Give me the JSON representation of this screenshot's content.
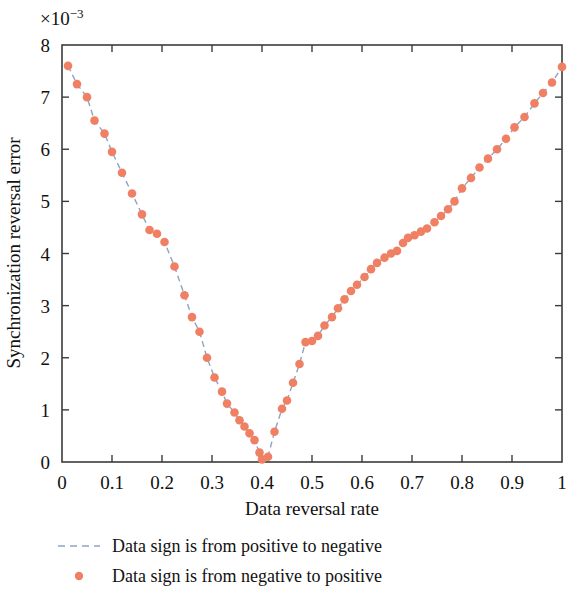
{
  "chart_data": {
    "type": "line",
    "title": "",
    "xlabel": "Data reversal rate",
    "ylabel": "Synchronization reversal error",
    "y_exponent_label": "×10",
    "y_exponent_power": "−3",
    "xlim": [
      0,
      1
    ],
    "ylim": [
      0,
      8
    ],
    "xticks": [
      0,
      0.1,
      0.2,
      0.3,
      0.4,
      0.5,
      0.6,
      0.7,
      0.8,
      0.9,
      1
    ],
    "xticklabels": [
      "0",
      "0.1",
      "0.2",
      "0.3",
      "0.4",
      "0.5",
      "0.6",
      "0.7",
      "0.8",
      "0.9",
      "1"
    ],
    "yticks": [
      0,
      1,
      2,
      3,
      4,
      5,
      6,
      7,
      8
    ],
    "yticklabels": [
      "0",
      "1",
      "2",
      "3",
      "4",
      "5",
      "6",
      "7",
      "8"
    ],
    "grid": false,
    "box": true,
    "tick_direction": "in",
    "ticks_all_sides": true,
    "legend_position": "below",
    "line_color": "#8ea2c6",
    "line_style": "dashed",
    "marker_color": "#ef8064",
    "marker_shape": "circle",
    "series": [
      {
        "name": "Data sign is from positive to negative",
        "style": "dashed-line",
        "x": [
          0.012,
          0.03,
          0.05,
          0.065,
          0.085,
          0.1,
          0.12,
          0.14,
          0.16,
          0.175,
          0.19,
          0.205,
          0.225,
          0.245,
          0.26,
          0.275,
          0.29,
          0.305,
          0.32,
          0.33,
          0.345,
          0.355,
          0.365,
          0.375,
          0.385,
          0.395,
          0.4,
          0.412,
          0.425,
          0.44,
          0.45,
          0.462,
          0.475,
          0.487,
          0.5,
          0.512,
          0.525,
          0.54,
          0.552,
          0.565,
          0.578,
          0.59,
          0.605,
          0.618,
          0.63,
          0.645,
          0.658,
          0.67,
          0.682,
          0.692,
          0.705,
          0.718,
          0.73,
          0.745,
          0.758,
          0.772,
          0.785,
          0.8,
          0.818,
          0.835,
          0.852,
          0.87,
          0.888,
          0.905,
          0.925,
          0.945,
          0.962,
          0.98,
          1.0
        ],
        "y": [
          7.6,
          7.25,
          7.0,
          6.55,
          6.3,
          5.95,
          5.55,
          5.15,
          4.75,
          4.45,
          4.38,
          4.22,
          3.75,
          3.2,
          2.78,
          2.5,
          2.0,
          1.62,
          1.35,
          1.12,
          0.95,
          0.8,
          0.68,
          0.55,
          0.42,
          0.18,
          0.05,
          0.1,
          0.58,
          1.02,
          1.18,
          1.52,
          1.88,
          2.3,
          2.32,
          2.42,
          2.62,
          2.78,
          2.95,
          3.12,
          3.28,
          3.4,
          3.55,
          3.7,
          3.82,
          3.92,
          4.0,
          4.05,
          4.2,
          4.3,
          4.35,
          4.42,
          4.48,
          4.6,
          4.72,
          4.85,
          5.0,
          5.25,
          5.45,
          5.65,
          5.82,
          6.0,
          6.2,
          6.42,
          6.62,
          6.88,
          7.08,
          7.28,
          7.58
        ]
      }
    ],
    "legend": [
      {
        "label": "Data sign is from positive to negative",
        "marker": "dashed-line",
        "color": "#8ea2c6"
      },
      {
        "label": "Data sign is from negative to positive",
        "marker": "circle",
        "color": "#ef8064"
      }
    ]
  }
}
